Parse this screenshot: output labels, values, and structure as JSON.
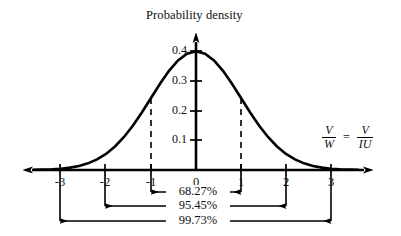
{
  "figure": {
    "title": "Probability density",
    "axis_label_right": {
      "left_fraction": {
        "numerator": "V",
        "denominator": "W"
      },
      "equals": "=",
      "right_fraction": {
        "numerator": "V",
        "denominator": "IU"
      }
    }
  },
  "chart_data": {
    "type": "line",
    "title": "Probability density",
    "xlabel": "V/W = V/IU",
    "ylabel": "Probability density",
    "xlim": [
      -3.6,
      3.6
    ],
    "ylim": [
      0,
      0.44
    ],
    "grid": false,
    "legend": null,
    "x_ticks": [
      "-3",
      "-2",
      "-1",
      "0",
      "1",
      "2",
      "3"
    ],
    "x_tick_values": [
      -3,
      -2,
      -1,
      0,
      1,
      2,
      3
    ],
    "y_ticks": [
      "0.1",
      "0.2",
      "0.3",
      "0.4"
    ],
    "y_tick_values": [
      0.1,
      0.2,
      0.3,
      0.4
    ],
    "series": [
      {
        "name": "standard normal density",
        "x": [
          -3.6,
          -3.4,
          -3.2,
          -3.0,
          -2.8,
          -2.6,
          -2.4,
          -2.2,
          -2.0,
          -1.8,
          -1.6,
          -1.4,
          -1.2,
          -1.0,
          -0.8,
          -0.6,
          -0.4,
          -0.2,
          0.0,
          0.2,
          0.4,
          0.6,
          0.8,
          1.0,
          1.2,
          1.4,
          1.6,
          1.8,
          2.0,
          2.2,
          2.4,
          2.6,
          2.8,
          3.0,
          3.2,
          3.4,
          3.6
        ],
        "values": [
          0.0006,
          0.0012,
          0.0024,
          0.0044,
          0.0079,
          0.0136,
          0.0224,
          0.0355,
          0.054,
          0.079,
          0.1109,
          0.1497,
          0.1942,
          0.242,
          0.2897,
          0.3332,
          0.3683,
          0.391,
          0.3989,
          0.391,
          0.3683,
          0.3332,
          0.2897,
          0.242,
          0.1942,
          0.1497,
          0.1109,
          0.079,
          0.054,
          0.0355,
          0.0224,
          0.0136,
          0.0079,
          0.0044,
          0.0024,
          0.0012,
          0.0006
        ]
      }
    ],
    "dashed_markers": [
      {
        "x": -1,
        "y": 0.242
      },
      {
        "x": 1,
        "y": 0.242
      }
    ],
    "annotations": [
      {
        "label": "68.27%",
        "from": -1,
        "to": 1,
        "row": 1
      },
      {
        "label": "95.45%",
        "from": -2,
        "to": 2,
        "row": 2
      },
      {
        "label": "99.73%",
        "from": -3,
        "to": 3,
        "row": 3
      }
    ]
  }
}
